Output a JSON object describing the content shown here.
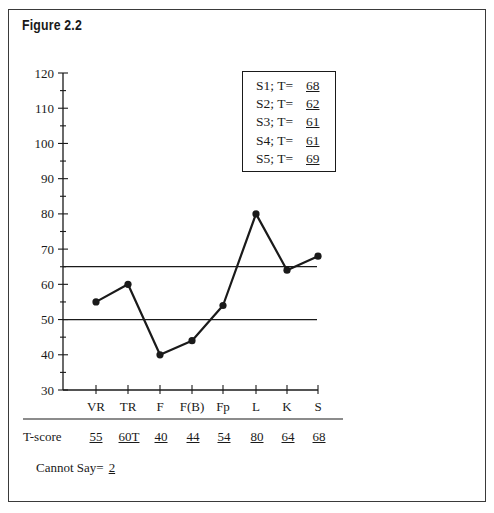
{
  "figure": {
    "title": "Figure 2.2"
  },
  "chart_data": {
    "type": "line",
    "title": "Figure 2.2",
    "xlabel": "",
    "ylabel": "T-score",
    "ylim": [
      30,
      120
    ],
    "y_ticks": [
      30,
      40,
      50,
      60,
      70,
      80,
      90,
      100,
      110,
      120
    ],
    "y_minor_tick_step": 5,
    "categories": [
      "VR",
      "TR",
      "F",
      "F(B)",
      "Fp",
      "L",
      "K",
      "S"
    ],
    "series": [
      {
        "name": "T-score",
        "values": [
          55,
          60,
          40,
          44,
          54,
          80,
          64,
          68
        ]
      }
    ],
    "reference_lines": [
      65,
      50
    ],
    "grid": false,
    "legend_position": "top-right-inset",
    "t_score_labels": [
      "55",
      "60T",
      "40",
      "44",
      "54",
      "80",
      "64",
      "68"
    ],
    "inset_table": [
      {
        "label": "S1; T=",
        "value": "68"
      },
      {
        "label": "S2; T=",
        "value": "62"
      },
      {
        "label": "S3; T=",
        "value": "61"
      },
      {
        "label": "S4; T=",
        "value": "61"
      },
      {
        "label": "S5; T=",
        "value": "69"
      }
    ],
    "annotations": [
      {
        "text": "Cannot Say=",
        "value": "2"
      }
    ]
  },
  "legend": {
    "rows": [
      {
        "label": "S1; T=",
        "value": "68"
      },
      {
        "label": "S2; T=",
        "value": "62"
      },
      {
        "label": "S3; T=",
        "value": "61"
      },
      {
        "label": "S4; T=",
        "value": "61"
      },
      {
        "label": "S5; T=",
        "value": "69"
      }
    ]
  },
  "scores": {
    "label": "T-score",
    "values": [
      "55",
      "60T",
      "40",
      "44",
      "54",
      "80",
      "64",
      "68"
    ]
  },
  "cannot_say": {
    "label": "Cannot Say=",
    "value": "2"
  },
  "colors": {
    "ink": "#1a1a1a",
    "frame": "#3a3a3a",
    "background": "#ffffff"
  }
}
